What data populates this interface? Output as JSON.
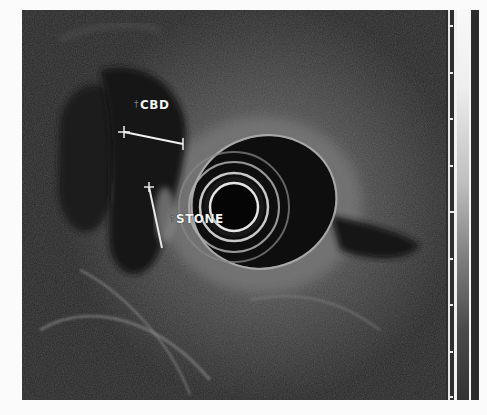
{
  "image": {
    "description": "Endoscopic ultrasound (EUS) radial scan showing common bile duct with a stone",
    "annotations": [
      {
        "id": "cbd",
        "text": "CBD",
        "marker": "†"
      },
      {
        "id": "stone",
        "text": "STONE",
        "marker": "†"
      }
    ],
    "measurements": [
      {
        "id": "cbd-diameter",
        "x1": 124,
        "y1": 132,
        "x2": 183,
        "y2": 144
      },
      {
        "id": "stone-length",
        "x1": 149,
        "y1": 187,
        "x2": 162,
        "y2": 248
      }
    ],
    "transducer": {
      "cx": 234,
      "cy": 207,
      "ring_radii": [
        24,
        34,
        45,
        55
      ]
    },
    "scale_bar": {
      "tick_y": [
        25,
        72,
        118,
        165,
        211,
        258,
        304,
        351,
        397
      ],
      "major_tick_index": 4
    },
    "colors": {
      "background": "#fbfbfb",
      "tissue": "#2a2a2a",
      "echo_bright": "#d8d8d8",
      "annotation_text": "#f4f4f4"
    }
  }
}
